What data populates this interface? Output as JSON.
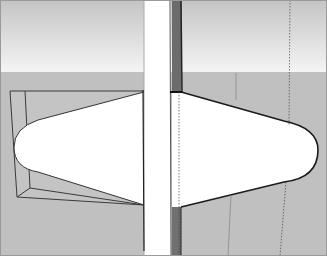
{
  "viewport": {
    "kind": "3d-modeling-viewport",
    "colors": {
      "sky_top": "#bdbdbd",
      "sky_bottom": "#f3f3f3",
      "ground": "#bfbfbf",
      "face_white": "#ffffff",
      "face_dark": "#6e6e6e",
      "edge": "#2a2a2a",
      "frame": "#9a9a9a"
    },
    "horizon_y": 72
  }
}
